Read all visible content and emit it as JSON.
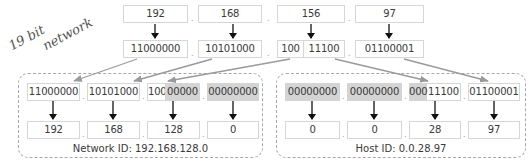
{
  "annotation": {
    "line1": "19 bit",
    "line2": "network"
  },
  "decimal_octets": [
    "192",
    "168",
    "156",
    "97"
  ],
  "binary_octets": [
    {
      "parts": [
        "11000000"
      ]
    },
    {
      "parts": [
        "10101000"
      ]
    },
    {
      "parts": [
        "100",
        "11100"
      ]
    },
    {
      "parts": [
        "01100001"
      ]
    }
  ],
  "network": {
    "binary": [
      {
        "network_bits": "11000000",
        "masked_bits": ""
      },
      {
        "network_bits": "10101000",
        "masked_bits": ""
      },
      {
        "network_bits": "100",
        "masked_bits": "00000"
      },
      {
        "network_bits": "",
        "masked_bits": "00000000"
      }
    ],
    "decimal": [
      "192",
      "168",
      "128",
      "0"
    ],
    "caption": "Network ID: 192.168.128.0"
  },
  "host": {
    "binary": [
      {
        "masked_bits": "00000000",
        "host_bits": ""
      },
      {
        "masked_bits": "00000000",
        "host_bits": ""
      },
      {
        "masked_bits": "000",
        "host_bits": "11100"
      },
      {
        "masked_bits": "",
        "host_bits": "01100001"
      }
    ],
    "decimal": [
      "0",
      "0",
      "28",
      "97"
    ],
    "caption": "Host ID: 0.0.28.97"
  },
  "separator": ".",
  "colors": {
    "mask_fill": "#d4d4d4",
    "box_border": "#d6d6d6",
    "arrow_black": "#111111",
    "arrow_gray": "#9a9a9a",
    "dashed_border": "#a8a8a8"
  }
}
